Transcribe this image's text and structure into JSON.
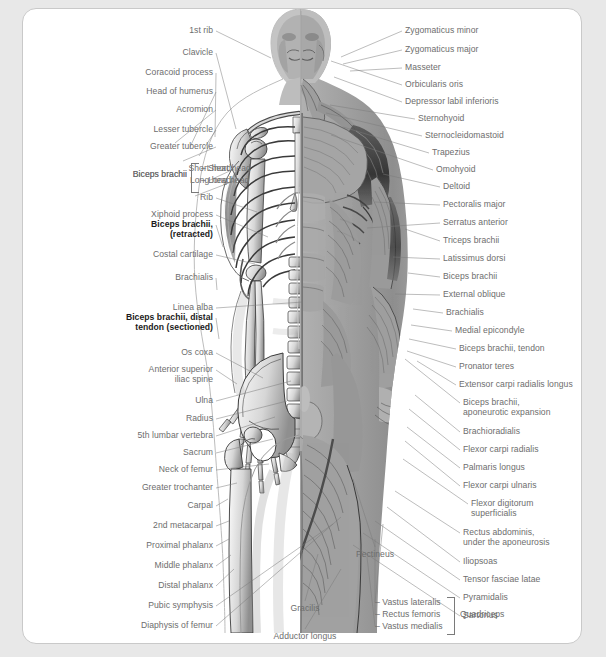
{
  "figure": {
    "alt_left": "skeleton-half",
    "alt_right": "muscle-half"
  },
  "colors": {
    "page_background": "#e8e8e8",
    "plate_background": "#ffffff",
    "plate_border": "#c9c9c9",
    "label_text": "#6d6d6d",
    "label_text_emphasis": "#1b1b1b",
    "leader_line": "#7a7a7a"
  },
  "labels_left": [
    {
      "text": "1st rib",
      "x": 190,
      "y": 22,
      "tx": 248,
      "ty": 49
    },
    {
      "text": "Clavicle",
      "x": 190,
      "y": 44,
      "tx": 213,
      "ty": 120
    },
    {
      "text": "Coracoid process",
      "x": 190,
      "y": 64,
      "tx": 192,
      "ty": 128
    },
    {
      "text": "Head of humerus",
      "x": 190,
      "y": 83,
      "tx": 167,
      "ty": 138
    },
    {
      "text": "Acromion",
      "x": 190,
      "y": 101,
      "tx": 152,
      "ty": 134
    },
    {
      "text": "Lesser tubercle",
      "x": 190,
      "y": 121,
      "tx": 176,
      "ty": 147
    },
    {
      "text": "Greater tubercle",
      "x": 190,
      "y": 138,
      "tx": 160,
      "ty": 152
    },
    {
      "text": "Short head",
      "x": 208,
      "y": 160,
      "tx": 185,
      "ty": 172
    },
    {
      "text": "Long head",
      "x": 208,
      "y": 172,
      "tx": 172,
      "ty": 187
    },
    {
      "text": "Biceps brachii",
      "x": 164,
      "y": 166,
      "tx": null,
      "ty": null
    },
    {
      "text": "Rib",
      "x": 190,
      "y": 189,
      "tx": 234,
      "ty": 203
    },
    {
      "text": "Xiphoid process",
      "x": 190,
      "y": 206,
      "tx": 245,
      "ty": 228
    },
    {
      "text": "Biceps brachii,\n(retracted)",
      "x": 190,
      "y": 216,
      "tx": 200,
      "ty": 238,
      "bold": true
    },
    {
      "text": "Costal cartilage",
      "x": 190,
      "y": 246,
      "tx": 232,
      "ty": 255
    },
    {
      "text": "Brachialis",
      "x": 190,
      "y": 269,
      "tx": 194,
      "ty": 281
    },
    {
      "text": "Linea alba",
      "x": 190,
      "y": 299,
      "tx": 280,
      "ty": 293
    },
    {
      "text": "Biceps brachii, distal\ntendon (sectioned)",
      "x": 190,
      "y": 309,
      "tx": 196,
      "ty": 330,
      "bold": true
    },
    {
      "text": "Os coxa",
      "x": 190,
      "y": 344,
      "tx": 240,
      "ty": 369
    },
    {
      "text": "Anterior superior\niliac spine",
      "x": 190,
      "y": 361,
      "tx": 214,
      "ty": 375
    },
    {
      "text": "Ulna",
      "x": 190,
      "y": 392,
      "tx": 268,
      "ty": 372
    },
    {
      "text": "Radius",
      "x": 190,
      "y": 410,
      "tx": 264,
      "ty": 392
    },
    {
      "text": "5th lumbar vertebra",
      "x": 190,
      "y": 427,
      "tx": 252,
      "ty": 408
    },
    {
      "text": "Sacrum",
      "x": 190,
      "y": 444,
      "tx": 250,
      "ty": 430
    },
    {
      "text": "Neck of femur",
      "x": 190,
      "y": 461,
      "tx": 246,
      "ty": 455
    },
    {
      "text": "Greater trochanter",
      "x": 190,
      "y": 479,
      "tx": 214,
      "ty": 474
    },
    {
      "text": "Carpal",
      "x": 190,
      "y": 497,
      "tx": 205,
      "ty": 490
    },
    {
      "text": "2nd metacarpal",
      "x": 190,
      "y": 517,
      "tx": 206,
      "ty": 512
    },
    {
      "text": "Proximal phalanx",
      "x": 190,
      "y": 537,
      "tx": 206,
      "ty": 530
    },
    {
      "text": "Middle phalanx",
      "x": 190,
      "y": 557,
      "tx": 208,
      "ty": 546
    },
    {
      "text": "Distal phalanx",
      "x": 190,
      "y": 577,
      "tx": 211,
      "ty": 560
    },
    {
      "text": "Pubic symphysis",
      "x": 190,
      "y": 597,
      "tx": 310,
      "ty": 515
    },
    {
      "text": "Diaphysis of femur",
      "x": 190,
      "y": 617,
      "tx": 318,
      "ty": 508
    }
  ],
  "labels_right": [
    {
      "text": "Zygomaticus minor",
      "x": 382,
      "y": 22,
      "tx": 318,
      "ty": 48
    },
    {
      "text": "Zygomaticus major",
      "x": 382,
      "y": 41,
      "tx": 320,
      "ty": 55
    },
    {
      "text": "Masseter",
      "x": 382,
      "y": 59,
      "tx": 327,
      "ty": 62
    },
    {
      "text": "Orbicularis oris",
      "x": 382,
      "y": 76,
      "tx": 308,
      "ty": 52
    },
    {
      "text": "Depressor labil inferioris",
      "x": 382,
      "y": 93,
      "tx": 311,
      "ty": 68
    },
    {
      "text": "Sternohyoid",
      "x": 395,
      "y": 110,
      "tx": 307,
      "ty": 96
    },
    {
      "text": "Sternocleidomastoid",
      "x": 402,
      "y": 127,
      "tx": 303,
      "ty": 104
    },
    {
      "text": "Trapezius",
      "x": 409,
      "y": 144,
      "tx": 320,
      "ty": 118
    },
    {
      "text": "Omohyoid",
      "x": 413,
      "y": 161,
      "tx": 308,
      "ty": 126
    },
    {
      "text": "Deltoid",
      "x": 420,
      "y": 178,
      "tx": 360,
      "ty": 165
    },
    {
      "text": "Pectoralis major",
      "x": 420,
      "y": 196,
      "tx": 352,
      "ty": 193
    },
    {
      "text": "Serratus anterior",
      "x": 420,
      "y": 214,
      "tx": 344,
      "ty": 219
    },
    {
      "text": "Triceps brachii",
      "x": 420,
      "y": 232,
      "tx": 382,
      "ty": 220
    },
    {
      "text": "Latissimus dorsi",
      "x": 420,
      "y": 250,
      "tx": 370,
      "ty": 248
    },
    {
      "text": "Biceps brachii",
      "x": 420,
      "y": 268,
      "tx": 385,
      "ty": 264
    },
    {
      "text": "External oblique",
      "x": 420,
      "y": 286,
      "tx": 372,
      "ty": 285
    },
    {
      "text": "Brachialis",
      "x": 423,
      "y": 304,
      "tx": 390,
      "ty": 300
    },
    {
      "text": "Medial epicondyle",
      "x": 432,
      "y": 322,
      "tx": 388,
      "ty": 316
    },
    {
      "text": "Biceps brachii, tendon",
      "x": 436,
      "y": 340,
      "tx": 386,
      "ty": 330
    },
    {
      "text": "Pronator teres",
      "x": 436,
      "y": 358,
      "tx": 384,
      "ty": 342
    },
    {
      "text": "Extensor carpi radialis longus",
      "x": 436,
      "y": 376,
      "tx": 394,
      "ty": 352
    },
    {
      "text": "Biceps brachii,\naponeurotic expansion",
      "x": 440,
      "y": 394,
      "tx": 382,
      "ty": 350
    },
    {
      "text": "Brachioradialis",
      "x": 440,
      "y": 423,
      "tx": 392,
      "ty": 386
    },
    {
      "text": "Flexor carpi radialis",
      "x": 440,
      "y": 441,
      "tx": 386,
      "ty": 400
    },
    {
      "text": "Palmaris longus",
      "x": 440,
      "y": 459,
      "tx": 384,
      "ty": 418
    },
    {
      "text": "Flexor carpi ulnaris",
      "x": 440,
      "y": 477,
      "tx": 382,
      "ty": 432
    },
    {
      "text": "Flexor digitorum\nsuperficialis",
      "x": 448,
      "y": 495,
      "tx": 380,
      "ty": 450
    },
    {
      "text": "Rectus abdominis,\nunder the aponeurosis",
      "x": 440,
      "y": 524,
      "tx": 372,
      "ty": 482
    },
    {
      "text": "Iliopsoas",
      "x": 440,
      "y": 553,
      "tx": 364,
      "ty": 498
    },
    {
      "text": "Tensor fasciae latae",
      "x": 440,
      "y": 571,
      "tx": 352,
      "ty": 512
    },
    {
      "text": "Pyramidalis",
      "x": 440,
      "y": 589,
      "tx": 340,
      "ty": 524
    },
    {
      "text": "Sartorius",
      "x": 440,
      "y": 607,
      "tx": 330,
      "ty": 536
    }
  ],
  "labels_bottom": [
    {
      "text": "Pectineus",
      "x": 352,
      "y": 546,
      "tx": 330,
      "ty": 470
    },
    {
      "text": "Gracilis",
      "x": 282,
      "y": 600,
      "tx": 295,
      "ty": 545
    },
    {
      "text": "Adductor longus",
      "x": 282,
      "y": 628,
      "tx": 318,
      "ty": 560
    }
  ],
  "quadriceps_group": {
    "bracket_label": "Quadriceps",
    "items": [
      {
        "text": "Vastus lateralis",
        "tx": 360,
        "ty": 515
      },
      {
        "text": "Rectus femoris",
        "tx": 352,
        "ty": 530
      },
      {
        "text": "Vastus medialis",
        "tx": 344,
        "ty": 548
      }
    ]
  },
  "biceps_group": {
    "bracket_label": "Biceps brachii",
    "items": [
      "Short head",
      "Long head"
    ]
  }
}
